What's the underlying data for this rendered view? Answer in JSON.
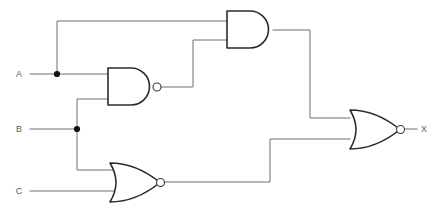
{
  "diagram": {
    "background_color": "#ffffff",
    "wire_color": "#6e6e6e",
    "gate_outline_color": "#2b2b2b",
    "label_color": "#5a5a5a"
  },
  "inputs": [
    {
      "id": "A",
      "label": "A",
      "label_x": 20,
      "label_y": 77,
      "line_y": 74
    },
    {
      "id": "B",
      "label": "B",
      "label_x": 20,
      "label_y": 132,
      "line_y": 129
    },
    {
      "id": "C",
      "label": "C",
      "label_x": 20,
      "label_y": 194,
      "line_y": 191
    }
  ],
  "outputs": [
    {
      "id": "X",
      "label": "X",
      "label_x": 421,
      "label_y": 132,
      "line_y": 129
    }
  ],
  "gates": [
    {
      "id": "and1",
      "type": "AND",
      "label": "AND gate",
      "x": 227,
      "y": 11,
      "width": 46,
      "height": 37,
      "inverted": false,
      "inputs": [
        "A",
        "nand1_out"
      ],
      "output": "and1_out"
    },
    {
      "id": "nand1",
      "type": "NAND",
      "label": "NAND gate",
      "x": 108,
      "y": 68,
      "width": 45,
      "height": 37,
      "inverted": true,
      "inputs": [
        "A",
        "B"
      ],
      "output": "nand1_out"
    },
    {
      "id": "nor1",
      "type": "NOR",
      "label": "NOR gate",
      "x": 110,
      "y": 163,
      "width": 46,
      "height": 39,
      "inverted": true,
      "inputs": [
        "B",
        "C"
      ],
      "output": "nor1_out"
    },
    {
      "id": "nor2",
      "type": "NOR",
      "label": "Output NOR gate",
      "x": 350,
      "y": 110,
      "width": 46,
      "height": 39,
      "inverted": true,
      "inputs": [
        "and1_out",
        "nor1_out"
      ],
      "output": "X"
    }
  ],
  "junctions": [
    {
      "id": "junction-a",
      "on": "A",
      "x": 57,
      "y": 74
    },
    {
      "id": "junction-b",
      "on": "B",
      "x": 77,
      "y": 129
    }
  ],
  "wires": [
    {
      "id": "wire-a-trunk",
      "path": "M 30 74 L 57 74 L 108 74"
    },
    {
      "id": "wire-a-branch-up",
      "path": "M 57 74 L 57 21 L 227 21"
    },
    {
      "id": "wire-b-trunk",
      "path": "M 30 129 L 77 129"
    },
    {
      "id": "wire-b-branch-up",
      "path": "M 77 129 L 77 99 L 108 99"
    },
    {
      "id": "wire-b-branch-down",
      "path": "M 77 129 L 77 170 L 116 170"
    },
    {
      "id": "wire-c-trunk",
      "path": "M 30 191 L 118 191"
    },
    {
      "id": "wire-nand1-out",
      "path": "M 161 87 L 193 87 L 193 40 L 227 40"
    },
    {
      "id": "wire-and1-out",
      "path": "M 273 30 L 310 30 L 310 118 L 350 118"
    },
    {
      "id": "wire-nor1-out",
      "path": "M 164 182 L 270 182 L 270 139 L 350 139"
    },
    {
      "id": "wire-x-out",
      "path": "M 404 129 L 417 129"
    }
  ]
}
